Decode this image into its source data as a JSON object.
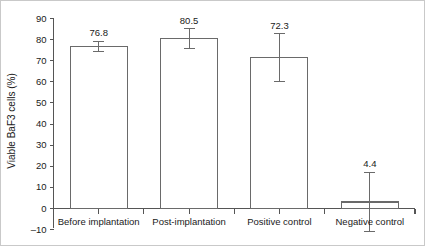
{
  "figure": {
    "background_color": "#ffffff",
    "border_color": "#c9c9c9",
    "bar_edge_color": "#6a6a6a",
    "bar_fill_color": "#ffffff",
    "axis_color": "#555555",
    "text_color": "#1a1a1a"
  },
  "chart_data": {
    "type": "bar",
    "title": "",
    "xlabel": "",
    "ylabel": "Viable BaF3 cells (%)",
    "categories": [
      "Before implantation",
      "Post-implantation",
      "Positive control",
      "Negative control"
    ],
    "values": [
      76.8,
      80.5,
      71.5,
      3.1
    ],
    "data_labels": [
      "76.8",
      "80.5",
      "72.3",
      "4.4"
    ],
    "errors": [
      2.5,
      4.6,
      11.2,
      14.0
    ],
    "ylim": [
      -10,
      90
    ],
    "ytick_step": 10,
    "ytick_labels": [
      "90",
      "80",
      "70",
      "60",
      "50",
      "40",
      "30",
      "20",
      "10",
      "0",
      "–10"
    ],
    "ytick_values": [
      90,
      80,
      70,
      60,
      50,
      40,
      30,
      20,
      10,
      0,
      -10
    ],
    "grid": false,
    "legend": null,
    "legend_position": "none",
    "series": [
      {
        "name": "Viable BaF3 cells (%)",
        "values": [
          76.8,
          80.5,
          71.5,
          3.1
        ],
        "errors": [
          2.5,
          4.6,
          11.2,
          14.0
        ]
      }
    ]
  }
}
